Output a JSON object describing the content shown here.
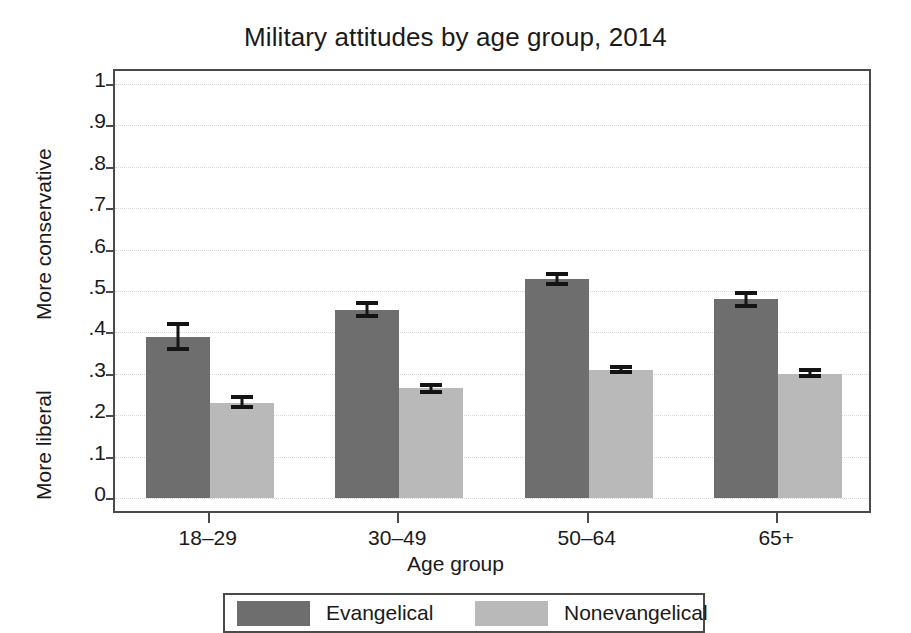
{
  "chart_data": {
    "type": "bar",
    "title": "Military attitudes by age group, 2014",
    "xlabel": "Age group",
    "ylabel_upper": "More conservative",
    "ylabel_lower": "More liberal",
    "categories": [
      "18–29",
      "30–49",
      "50–64",
      "65+"
    ],
    "ylim": [
      0,
      1
    ],
    "yticks": [
      "0",
      ".1",
      ".2",
      ".3",
      ".4",
      ".5",
      ".6",
      ".7",
      ".8",
      ".9",
      "1"
    ],
    "ytick_values": [
      0,
      0.1,
      0.2,
      0.3,
      0.4,
      0.5,
      0.6,
      0.7,
      0.8,
      0.9,
      1
    ],
    "grid": true,
    "legend_position": "bottom",
    "series": [
      {
        "name": "Evangelical",
        "color": "#6e6e6e",
        "values": [
          0.39,
          0.455,
          0.53,
          0.48
        ],
        "error_low": [
          0.355,
          0.435,
          0.513,
          0.46
        ],
        "error_high": [
          0.425,
          0.475,
          0.547,
          0.5
        ]
      },
      {
        "name": "Nonevangelical",
        "color": "#b9b9b9",
        "values": [
          0.23,
          0.265,
          0.31,
          0.3
        ],
        "error_low": [
          0.215,
          0.25,
          0.3,
          0.29
        ],
        "error_high": [
          0.25,
          0.278,
          0.322,
          0.313
        ]
      }
    ]
  },
  "legend": {
    "items": [
      {
        "label": "Evangelical",
        "color": "#6e6e6e"
      },
      {
        "label": "Nonevangelical",
        "color": "#b9b9b9"
      }
    ]
  }
}
